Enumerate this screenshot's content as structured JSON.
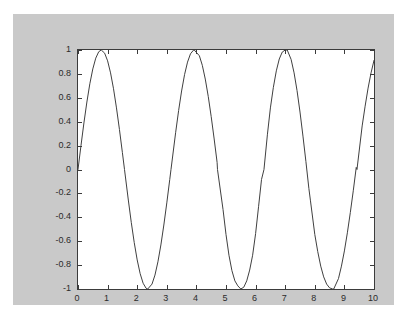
{
  "figure": {
    "background_color": "#c9c9c9",
    "page_color": "#ffffff",
    "axes_background_color": "#ffffff",
    "axes_border_color": "#3b3b3b",
    "line_color": "#404040"
  },
  "chart_data": {
    "type": "line",
    "title": "",
    "subtitle": "",
    "xlabel": "",
    "ylabel": "",
    "legend": [],
    "legend_position": "none",
    "grid": false,
    "xlim": [
      0,
      10
    ],
    "ylim": [
      -1,
      1
    ],
    "xticks": [
      0,
      1,
      2,
      3,
      4,
      5,
      6,
      7,
      8,
      9,
      10
    ],
    "xtick_labels": [
      "0",
      "1",
      "2",
      "3",
      "4",
      "5",
      "6",
      "7",
      "8",
      "9",
      "10"
    ],
    "yticks": [
      -1,
      -0.8,
      -0.6,
      -0.4,
      -0.2,
      0,
      0.2,
      0.4,
      0.6,
      0.8,
      1
    ],
    "ytick_labels": [
      "-1",
      "-0.8",
      "-0.6",
      "-0.4",
      "-0.2",
      "0",
      "0.2",
      "0.4",
      "0.6",
      "0.8",
      "1"
    ],
    "tick_direction": "in",
    "ticks_on_all_sides": true,
    "series": [
      {
        "name": "sin(2x)",
        "expression": "sin(2*x)",
        "line_width": 1,
        "x": [
          0,
          0.1,
          0.2,
          0.3,
          0.4,
          0.5,
          0.6,
          0.7,
          0.7854,
          0.9,
          1,
          1.1,
          1.2,
          1.3,
          1.4,
          1.5,
          1.5708,
          1.7,
          1.8,
          1.9,
          2,
          2.1,
          2.2,
          2.3,
          2.3562,
          2.5,
          2.6,
          2.7,
          2.8,
          2.9,
          3,
          3.1,
          3.1416,
          3.3,
          3.4,
          3.5,
          3.6,
          3.7,
          3.8,
          3.9,
          3.927,
          4.1,
          4.2,
          4.3,
          4.4,
          4.5,
          4.6,
          4.7,
          4.7124,
          4.9,
          5,
          5.1,
          5.2,
          5.3,
          5.4,
          5.5,
          5.4978,
          5.6,
          5.7,
          5.8,
          5.9,
          6,
          6.1,
          6.2,
          6.2832,
          6.4,
          6.5,
          6.6,
          6.7,
          6.8,
          6.9,
          7,
          7.0686,
          7.2,
          7.3,
          7.4,
          7.5,
          7.6,
          7.7,
          7.8,
          7.854,
          8,
          8.1,
          8.2,
          8.3,
          8.4,
          8.5,
          8.6,
          8.6394,
          8.8,
          8.9,
          9,
          9.1,
          9.2,
          9.3,
          9.4,
          9.4248,
          9.6,
          9.7,
          9.8,
          9.9,
          10
        ],
        "y": [
          0,
          0.1987,
          0.3894,
          0.5646,
          0.7174,
          0.8415,
          0.932,
          0.9854,
          1,
          0.9738,
          0.9093,
          0.8085,
          0.6755,
          0.5155,
          0.335,
          0.1411,
          0,
          -0.2555,
          -0.4425,
          -0.6119,
          -0.7568,
          -0.8716,
          -0.9516,
          -0.9937,
          -1,
          -0.9589,
          -0.8835,
          -0.7728,
          -0.6313,
          -0.4646,
          -0.2794,
          -0.0831,
          0,
          0.3115,
          0.4941,
          0.657,
          0.7937,
          0.8987,
          0.9679,
          0.9985,
          1,
          0.9516,
          0.8716,
          0.7568,
          0.6119,
          0.4425,
          0.2555,
          0.0585,
          0,
          -0.335,
          -0.544,
          -0.7174,
          -0.8462,
          -0.932,
          -0.9738,
          -0.9999,
          -1,
          -0.9854,
          -0.932,
          -0.8415,
          -0.7174,
          -0.5366,
          -0.3115,
          -0.0831,
          0,
          0.2955,
          0.5155,
          0.6877,
          0.8254,
          0.9249,
          0.9825,
          0.9998,
          1,
          0.9211,
          0.8085,
          0.6603,
          0.4808,
          0.2794,
          0.0664,
          -0.1593,
          -0.2624,
          -0.544,
          -0.6877,
          -0.8085,
          -0.8987,
          -0.9589,
          -0.9906,
          -0.9996,
          -1,
          -0.9129,
          -0.8085,
          -0.6813,
          -0.5297,
          -0.3602,
          -0.1781,
          0.0177,
          0,
          0.3646,
          0.5298,
          0.6813,
          0.8085,
          0.9129
        ]
      }
    ]
  }
}
